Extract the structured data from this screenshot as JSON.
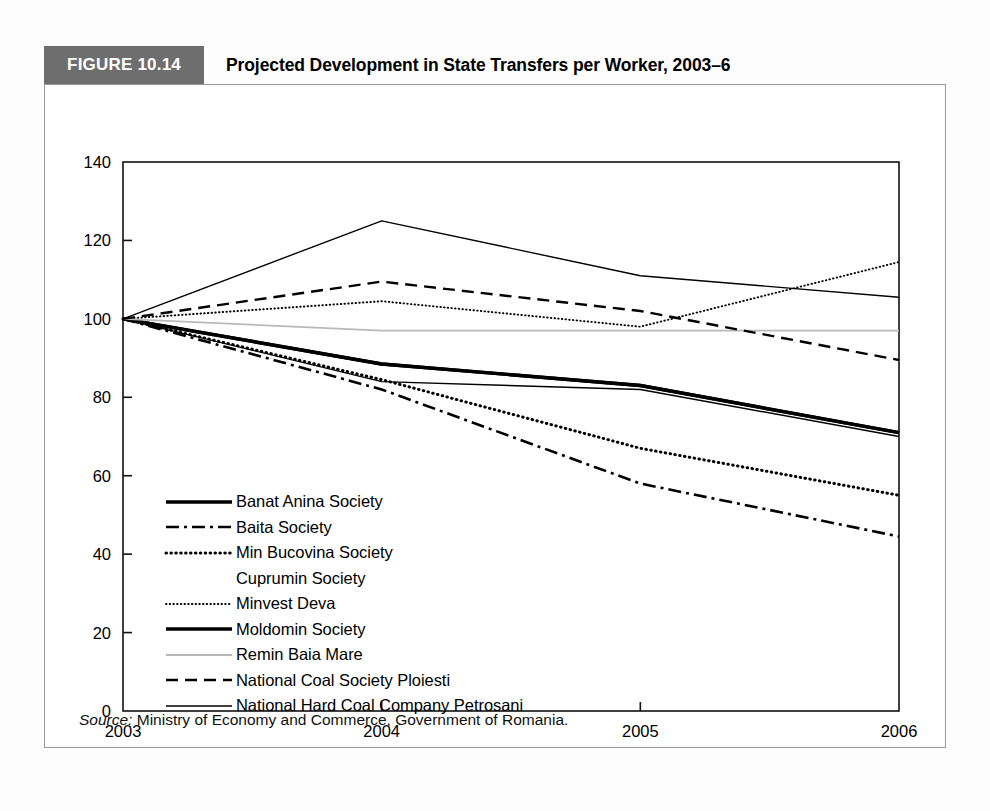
{
  "figure": {
    "badge": "FIGURE 10.14",
    "title": "Projected Development in State Transfers per Worker, 2003–6",
    "source_label": "Source:",
    "source_text": " Ministry of Economy and Commerce, Government of Romania."
  },
  "chart_data": {
    "type": "line",
    "title": "Projected Development in State Transfers per Worker, 2003–6",
    "xlabel": "",
    "ylabel": "",
    "x": [
      "2003",
      "2004",
      "2005",
      "2006"
    ],
    "categories": [
      "2003",
      "2004",
      "2005",
      "2006"
    ],
    "xtick_labels": [
      "2003",
      "2004",
      "2005",
      "2006"
    ],
    "ytick_labels": [
      "0",
      "20",
      "40",
      "60",
      "80",
      "100",
      "120",
      "140"
    ],
    "ylim": [
      0,
      140
    ],
    "ytick_step": 20,
    "grid": false,
    "legend_position": "inside-lower-left",
    "series": [
      {
        "name": "Banat Anina Society",
        "style": "solid-thick",
        "color": "#000000",
        "values": [
          100,
          88.5,
          83,
          71
        ]
      },
      {
        "name": "Baita Society",
        "style": "dash-dot",
        "color": "#000000",
        "values": [
          100,
          82,
          58,
          44.5
        ]
      },
      {
        "name": "Min Bucovina Society",
        "style": "dotted-thick",
        "color": "#000000",
        "values": [
          100,
          84.5,
          67,
          55
        ]
      },
      {
        "name": "Cuprumin Society",
        "style": "none",
        "color": "#000000",
        "values": [
          100,
          84,
          84,
          84
        ]
      },
      {
        "name": "Minvest Deva",
        "style": "dotted-fine",
        "color": "#000000",
        "values": [
          100,
          104.5,
          98,
          114.5
        ]
      },
      {
        "name": "Moldomin Society",
        "style": "solid-thick",
        "color": "#000000",
        "values": [
          100,
          88.5,
          83,
          71
        ]
      },
      {
        "name": "Remin Baia Mare",
        "style": "solid-thin-gray",
        "color": "#b9b9b9",
        "values": [
          100,
          97,
          97,
          97
        ]
      },
      {
        "name": "National Coal Society Ploiesti",
        "style": "dashed",
        "color": "#000000",
        "values": [
          100,
          109.5,
          102,
          89.5
        ]
      },
      {
        "name": "National Hard Coal Company Petrosani",
        "style": "solid-thin",
        "color": "#000000",
        "values": [
          100,
          125,
          111,
          105.5
        ]
      }
    ],
    "extra_series": [
      {
        "name": "Cuprumin Society",
        "style": "solid-thin",
        "values": [
          100,
          84,
          82,
          70
        ]
      }
    ]
  },
  "legend": {
    "items": [
      {
        "label": "Banat Anina Society",
        "key": "solid-thick"
      },
      {
        "label": "Baita Society",
        "key": "dash-dot"
      },
      {
        "label": "Min Bucovina Society",
        "key": "dotted-thick"
      },
      {
        "label": "Cuprumin Society",
        "key": "none"
      },
      {
        "label": "Minvest Deva",
        "key": "dotted-fine"
      },
      {
        "label": "Moldomin Society",
        "key": "solid-thick"
      },
      {
        "label": "Remin Baia Mare",
        "key": "solid-thin-gray"
      },
      {
        "label": "National Coal Society Ploiesti",
        "key": "dashed"
      },
      {
        "label": "National Hard Coal Company Petrosani",
        "key": "solid-thin"
      }
    ]
  },
  "colors": {
    "badge_bg": "#6e6e6e",
    "frame": "#9a9a9a",
    "axis": "#000000",
    "gray_series": "#b9b9b9"
  }
}
